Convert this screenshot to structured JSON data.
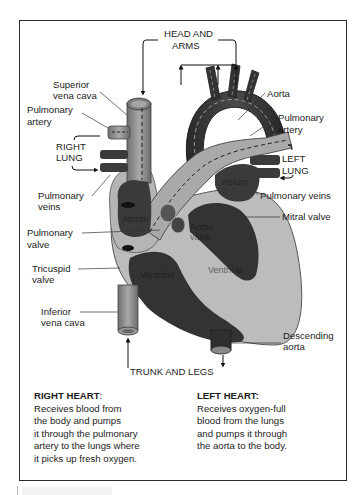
{
  "diagram": {
    "flow_labels": {
      "head_and_arms_line1": "HEAD AND",
      "head_and_arms_line2": "ARMS",
      "trunk_and_legs": "TRUNK AND LEGS",
      "right_lung_line1": "RIGHT",
      "right_lung_line2": "LUNG",
      "left_lung_line1": "LEFT",
      "left_lung_line2": "LUNG"
    },
    "left_labels": {
      "superior_vena_cava_line1": "Superior",
      "superior_vena_cava_line2": "vena cava",
      "pulmonary_artery_line1": "Pulmonary",
      "pulmonary_artery_line2": "artery",
      "pulmonary_veins_line1": "Pulmonary",
      "pulmonary_veins_line2": "veins",
      "pulmonary_valve_line1": "Pulmonary",
      "pulmonary_valve_line2": "valve",
      "tricuspid_valve_line1": "Tricuspid",
      "tricuspid_valve_line2": "valve",
      "inferior_vena_cava_line1": "Inferior",
      "inferior_vena_cava_line2": "vena cava"
    },
    "right_labels": {
      "aorta": "Aorta",
      "pulmonary_artery_line1": "Pulmonary",
      "pulmonary_artery_line2": "artery",
      "pulmonary_veins": "Pulmonary veins",
      "mitral_valve": "Mitral valve",
      "descending_aorta_line1": "Descending",
      "descending_aorta_line2": "aorta"
    },
    "inner_labels": {
      "right_atrium": "Atrium",
      "left_atrium": "Atrium",
      "aortic_valve_line1": "Aortic",
      "aortic_valve_line2": "valve",
      "right_ventricle": "Ventricle",
      "left_ventricle": "Ventricle"
    }
  },
  "descriptions": {
    "right_heart": {
      "title": "RIGHT HEART",
      "colon": ":",
      "lines": [
        "Receives blood from",
        "the body and pumps",
        "it through the pulmonary",
        "artery to the lungs where",
        "it picks up fresh oxygen."
      ]
    },
    "left_heart": {
      "title": "LEFT HEART:",
      "lines": [
        "Receives oxygen-full",
        "blood from the lungs",
        "and pumps it through",
        "the aorta to the body."
      ]
    }
  },
  "colors": {
    "frame": "#2b2b2b",
    "dark_tissue": "#3a3a3a",
    "mid_tissue": "#8e8e8e",
    "light_tissue": "#bdbdbd",
    "background": "#ffffff"
  }
}
